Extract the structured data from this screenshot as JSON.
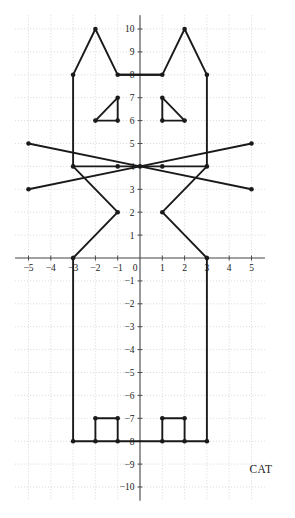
{
  "figure": {
    "caption": "CAT",
    "caption_position": "bottom-right"
  },
  "chart_data": {
    "type": "scatter",
    "title": "CAT",
    "subtitle": "",
    "xlabel": "",
    "ylabel": "",
    "xlim": [
      -5.6,
      5.6
    ],
    "ylim": [
      -10.6,
      10.6
    ],
    "grid": true,
    "legend": null,
    "x_ticks": [
      -5,
      -4,
      -3,
      -2,
      -1,
      1,
      2,
      3,
      4,
      5
    ],
    "y_ticks": [
      -10,
      -9,
      -8,
      -7,
      -6,
      -5,
      -4,
      -3,
      -2,
      -1,
      1,
      2,
      3,
      4,
      5,
      6,
      7,
      8,
      9,
      10
    ],
    "x_tick_labels": [
      "−5",
      "−4",
      "−3",
      "−2",
      "−1",
      "1",
      "2",
      "3",
      "4",
      "5"
    ],
    "y_tick_labels": [
      "−10",
      "−9",
      "−8",
      "−7",
      "−6",
      "−5",
      "−4",
      "−3",
      "−2",
      "−1",
      "1",
      "2",
      "3",
      "4",
      "5",
      "6",
      "7",
      "8",
      "9",
      "10"
    ],
    "origin_label": "0",
    "unit_px_x": 22.3,
    "unit_px_y": 22.9,
    "origin_px": [
      140,
      258
    ],
    "series": [
      {
        "name": "head-and-ears-outline",
        "closed": false,
        "points": [
          [
            -3,
            4
          ],
          [
            -3,
            8
          ],
          [
            -2,
            10
          ],
          [
            -1,
            8
          ],
          [
            1,
            8
          ],
          [
            2,
            10
          ],
          [
            3,
            8
          ],
          [
            3,
            4
          ]
        ]
      },
      {
        "name": "mouth-bar",
        "closed": false,
        "points": [
          [
            -1,
            8
          ],
          [
            1,
            8
          ]
        ]
      },
      {
        "name": "eye-left",
        "closed": true,
        "points": [
          [
            -2,
            6
          ],
          [
            -1,
            7
          ],
          [
            -1,
            6
          ]
        ]
      },
      {
        "name": "eye-right",
        "closed": true,
        "points": [
          [
            1,
            7
          ],
          [
            1,
            6
          ],
          [
            2,
            6
          ]
        ]
      },
      {
        "name": "whisker-left-upper",
        "closed": false,
        "points": [
          [
            -5,
            5
          ],
          [
            0,
            4
          ]
        ]
      },
      {
        "name": "whisker-left-lower",
        "closed": false,
        "points": [
          [
            -5,
            3
          ],
          [
            0,
            4
          ]
        ]
      },
      {
        "name": "whisker-right-upper",
        "closed": false,
        "points": [
          [
            5,
            5
          ],
          [
            0,
            4
          ]
        ]
      },
      {
        "name": "whisker-right-lower",
        "closed": false,
        "points": [
          [
            5,
            3
          ],
          [
            0,
            4
          ]
        ]
      },
      {
        "name": "nose-bar",
        "closed": false,
        "points": [
          [
            -3,
            4
          ],
          [
            3,
            4
          ]
        ]
      },
      {
        "name": "jaw-left",
        "closed": false,
        "points": [
          [
            -3,
            4
          ],
          [
            -1,
            2
          ],
          [
            -3,
            0
          ]
        ]
      },
      {
        "name": "jaw-right",
        "closed": false,
        "points": [
          [
            3,
            4
          ],
          [
            1,
            2
          ],
          [
            3,
            0
          ]
        ]
      },
      {
        "name": "body-left-side",
        "closed": false,
        "points": [
          [
            -3,
            0
          ],
          [
            -3,
            -8
          ]
        ]
      },
      {
        "name": "body-right-side",
        "closed": false,
        "points": [
          [
            3,
            0
          ],
          [
            3,
            -8
          ]
        ]
      },
      {
        "name": "body-bottom",
        "closed": false,
        "points": [
          [
            -3,
            -8
          ],
          [
            3,
            -8
          ]
        ]
      },
      {
        "name": "foot-left",
        "closed": false,
        "points": [
          [
            -2,
            -8
          ],
          [
            -2,
            -7
          ],
          [
            -1,
            -7
          ],
          [
            -1,
            -8
          ]
        ]
      },
      {
        "name": "foot-right",
        "closed": false,
        "points": [
          [
            1,
            -8
          ],
          [
            1,
            -7
          ],
          [
            2,
            -7
          ],
          [
            2,
            -8
          ]
        ]
      }
    ],
    "vertices": [
      [
        -3,
        8
      ],
      [
        -2,
        10
      ],
      [
        -1,
        8
      ],
      [
        1,
        8
      ],
      [
        2,
        10
      ],
      [
        3,
        8
      ],
      [
        -2,
        6
      ],
      [
        -1,
        7
      ],
      [
        -1,
        6
      ],
      [
        1,
        7
      ],
      [
        1,
        6
      ],
      [
        2,
        6
      ],
      [
        -5,
        5
      ],
      [
        -5,
        3
      ],
      [
        5,
        5
      ],
      [
        5,
        3
      ],
      [
        -3,
        4
      ],
      [
        0,
        4
      ],
      [
        3,
        4
      ],
      [
        1,
        4
      ],
      [
        -1,
        4
      ],
      [
        -1,
        2
      ],
      [
        1,
        2
      ],
      [
        -3,
        0
      ],
      [
        3,
        0
      ],
      [
        -3,
        -8
      ],
      [
        -2,
        -8
      ],
      [
        -2,
        -7
      ],
      [
        -1,
        -7
      ],
      [
        -1,
        -8
      ],
      [
        1,
        -8
      ],
      [
        1,
        -7
      ],
      [
        2,
        -7
      ],
      [
        2,
        -8
      ],
      [
        3,
        -8
      ]
    ]
  }
}
